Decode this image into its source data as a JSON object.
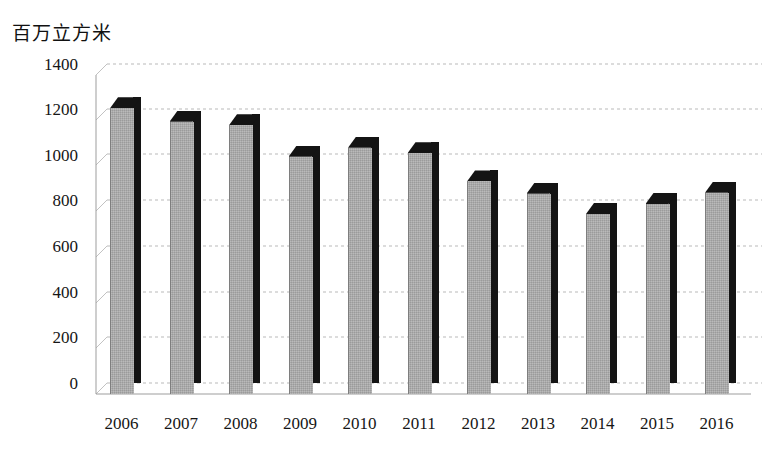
{
  "chart_data": {
    "type": "bar",
    "title": "百万立方米",
    "xlabel": "",
    "ylabel": "百万立方米",
    "categories": [
      "2006",
      "2007",
      "2008",
      "2009",
      "2010",
      "2011",
      "2012",
      "2013",
      "2014",
      "2015",
      "2016"
    ],
    "values": [
      1270,
      1210,
      1195,
      1055,
      1095,
      1070,
      945,
      890,
      800,
      845,
      895
    ],
    "series": [
      {
        "name": "",
        "values": [
          1270,
          1210,
          1195,
          1055,
          1095,
          1070,
          945,
          890,
          800,
          845,
          895
        ]
      }
    ],
    "ylim": [
      0,
      1400
    ],
    "yticks": [
      0,
      200,
      400,
      600,
      800,
      1000,
      1200,
      1400
    ],
    "ytick_labels": [
      "0",
      "200",
      "400",
      "600",
      "800",
      "1000",
      "1200",
      "1400"
    ],
    "grid": true,
    "grid_style": "dashed-horizontal",
    "legend": false,
    "legend_position": "none",
    "style": "3d-column",
    "bar_color": "#a9a9a9",
    "bar_shadow_color": "#141414",
    "grid_color": "#b7b7b7",
    "background": "#ffffff"
  },
  "axis": {
    "y_title": "百万立方米",
    "y_ticks": [
      "1400",
      "1200",
      "1000",
      "800",
      "600",
      "400",
      "200",
      "0"
    ],
    "x_ticks": [
      "2006",
      "2007",
      "2008",
      "2009",
      "2010",
      "2011",
      "2012",
      "2013",
      "2014",
      "2015",
      "2016"
    ]
  }
}
